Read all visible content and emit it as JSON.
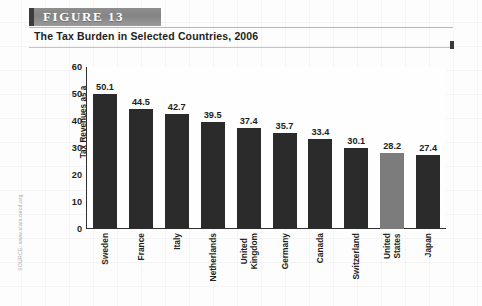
{
  "figure": {
    "banner_label": "FIGURE  13",
    "subtitle": "The Tax Burden in Selected Countries, 2006",
    "source": "SOURCE: www.stats.oecd.org"
  },
  "colors": {
    "bar": "#2b2b2b",
    "bar_highlight": "#7c7c7c",
    "banner": "#8a8a8a",
    "axis": "#2f2f2f",
    "text": "#231f20"
  },
  "chart_data": {
    "type": "bar",
    "title": "The Tax Burden in Selected Countries, 2006",
    "subtitle": "",
    "xlabel": "",
    "ylabel": "Tax Revenues as a Percentage of GDP",
    "ylabel_lines": [
      "Tax Revenues as a",
      "Percentage of GDP"
    ],
    "ylim": [
      0,
      60
    ],
    "yticks": [
      0,
      10,
      20,
      30,
      40,
      50,
      60
    ],
    "ytick_labels": [
      "0",
      "10",
      "20",
      "30",
      "40",
      "50",
      "60"
    ],
    "grid": false,
    "legend": "none",
    "highlight_category": "United States",
    "categories": [
      "Sweden",
      "France",
      "Italy",
      "Netherlands",
      "United Kingdom",
      "Germany",
      "Canada",
      "Switzerland",
      "United States",
      "Japan"
    ],
    "category_lines": [
      [
        "Sweden"
      ],
      [
        "France"
      ],
      [
        "Italy"
      ],
      [
        "Netherlands"
      ],
      [
        "United",
        "Kingdom"
      ],
      [
        "Germany"
      ],
      [
        "Canada"
      ],
      [
        "Switzerland"
      ],
      [
        "United",
        "States"
      ],
      [
        "Japan"
      ]
    ],
    "values": [
      50.1,
      44.5,
      42.7,
      39.5,
      37.4,
      35.7,
      33.4,
      30.1,
      28.2,
      27.4
    ],
    "value_labels": [
      "50.1",
      "44.5",
      "42.7",
      "39.5",
      "37.4",
      "35.7",
      "33.4",
      "30.1",
      "28.2",
      "27.4"
    ]
  }
}
